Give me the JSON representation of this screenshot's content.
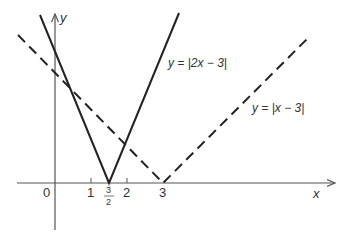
{
  "diagram": {
    "axes": {
      "x_label": "x",
      "y_label": "y",
      "origin_label": "0"
    },
    "ticks": [
      {
        "label": "1",
        "value": 1
      },
      {
        "label_num": "3",
        "label_den": "2",
        "value": 1.5
      },
      {
        "label": "2",
        "value": 2
      },
      {
        "label": "3",
        "value": 3
      }
    ],
    "curves": [
      {
        "name": "abs-2x-minus-3",
        "label": "y = |2x − 3|",
        "style": "solid",
        "vertex": [
          1.5,
          0
        ]
      },
      {
        "name": "abs-x-minus-3",
        "label": "y = |x − 3|",
        "style": "dashed",
        "vertex": [
          3,
          0
        ]
      }
    ]
  }
}
